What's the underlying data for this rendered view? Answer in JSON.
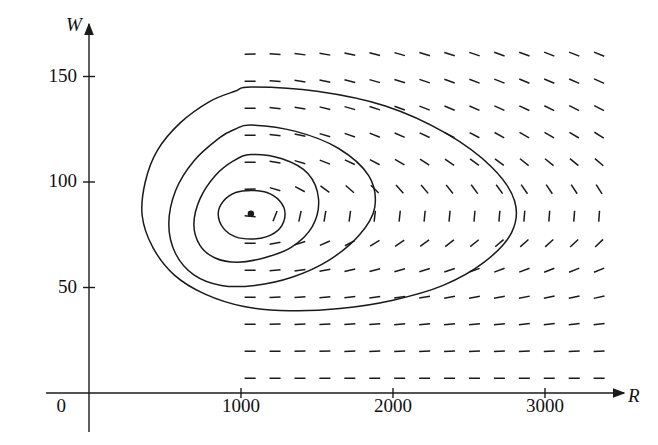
{
  "figure": {
    "kind": "phase-portrait",
    "background": "#ffffff",
    "ink_color": "#1a1a1a"
  },
  "axes": {
    "x_axis_label": "R",
    "y_axis_label": "W",
    "origin_label": "0",
    "x_ticks": [
      {
        "value": 1000,
        "label": "1000"
      },
      {
        "value": 2000,
        "label": "2000"
      },
      {
        "value": 3000,
        "label": "3000"
      }
    ],
    "y_ticks": [
      {
        "value": 50,
        "label": "50"
      },
      {
        "value": 100,
        "label": "100"
      },
      {
        "value": 150,
        "label": "150"
      }
    ],
    "x_range": [
      0,
      3530
    ],
    "y_range": [
      -22,
      172
    ]
  },
  "chart_data": {
    "type": "scatter",
    "title": "",
    "xlabel": "R",
    "ylabel": "W",
    "xlim": [
      0,
      3530
    ],
    "ylim": [
      -22,
      172
    ],
    "grid": false,
    "legend": null,
    "equilibrium_point": {
      "R": 1065,
      "W": 85,
      "marker": "filled-circle"
    },
    "orbits": [
      {
        "name": "orbit-1-innermost",
        "points": [
          [
            1065,
            96
          ],
          [
            1170,
            95
          ],
          [
            1255,
            91
          ],
          [
            1290,
            85
          ],
          [
            1255,
            78
          ],
          [
            1165,
            74
          ],
          [
            1065,
            73
          ],
          [
            965,
            74
          ],
          [
            885,
            78
          ],
          [
            850,
            85
          ],
          [
            885,
            91
          ],
          [
            965,
            95
          ]
        ]
      },
      {
        "name": "orbit-2",
        "points": [
          [
            1065,
            113
          ],
          [
            1270,
            111
          ],
          [
            1440,
            104
          ],
          [
            1510,
            92
          ],
          [
            1470,
            79
          ],
          [
            1330,
            69
          ],
          [
            1150,
            64
          ],
          [
            975,
            62
          ],
          [
            830,
            64
          ],
          [
            730,
            70
          ],
          [
            690,
            80
          ],
          [
            730,
            92
          ],
          [
            830,
            103
          ],
          [
            950,
            110
          ]
        ]
      },
      {
        "name": "orbit-3",
        "points": [
          [
            1065,
            127
          ],
          [
            1360,
            124
          ],
          [
            1640,
            116
          ],
          [
            1840,
            103
          ],
          [
            1880,
            88
          ],
          [
            1780,
            75
          ],
          [
            1580,
            63
          ],
          [
            1340,
            55
          ],
          [
            1090,
            51
          ],
          [
            870,
            51
          ],
          [
            690,
            56
          ],
          [
            570,
            66
          ],
          [
            525,
            80
          ],
          [
            570,
            96
          ],
          [
            690,
            110
          ],
          [
            860,
            121
          ],
          [
            960,
            125
          ]
        ]
      },
      {
        "name": "orbit-4-outermost",
        "points": [
          [
            1065,
            145
          ],
          [
            1500,
            143
          ],
          [
            1950,
            136
          ],
          [
            2350,
            123
          ],
          [
            2650,
            107
          ],
          [
            2800,
            91
          ],
          [
            2780,
            76
          ],
          [
            2600,
            62
          ],
          [
            2330,
            51
          ],
          [
            2000,
            44
          ],
          [
            1650,
            40
          ],
          [
            1320,
            39
          ],
          [
            1020,
            41
          ],
          [
            760,
            47
          ],
          [
            560,
            56
          ],
          [
            420,
            69
          ],
          [
            350,
            84
          ],
          [
            370,
            100
          ],
          [
            450,
            115
          ],
          [
            600,
            128
          ],
          [
            790,
            138
          ],
          [
            960,
            143
          ]
        ]
      }
    ],
    "direction_field": {
      "description": "dashed line-segment slope field for a Lotka-Volterra predator-prey system, segments drawn on a regular grid",
      "cols": 20,
      "rows": 13,
      "x_start": 1060,
      "x_step": 164,
      "y_start": 7,
      "y_step": 12.8,
      "dash_length_px": 11
    }
  }
}
